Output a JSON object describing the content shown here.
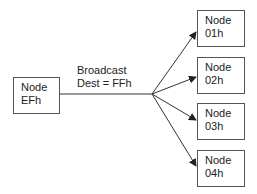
{
  "diagram": {
    "source": {
      "line1": "Node",
      "line2": "EFh"
    },
    "edge_label": {
      "line1": "Broadcast",
      "line2": "Dest = FFh"
    },
    "targets": [
      {
        "line1": "Node",
        "line2": "01h"
      },
      {
        "line1": "Node",
        "line2": "02h"
      },
      {
        "line1": "Node",
        "line2": "03h"
      },
      {
        "line1": "Node",
        "line2": "04h"
      }
    ],
    "colors": {
      "line": "#333333",
      "border": "#555555",
      "background": "#ffffff"
    }
  }
}
